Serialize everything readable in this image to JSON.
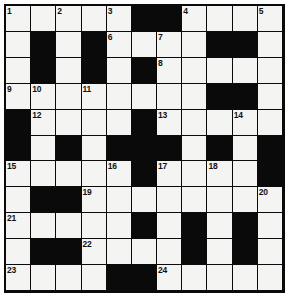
{
  "puzzle": {
    "title": "Crossword Grid",
    "type": "crossword",
    "rows": 11,
    "columns": 11,
    "colors": {
      "white_cell": "#f4f4f2",
      "black_cell": "#0a0a0a",
      "grid_line": "#0a0a0a",
      "number_text": "#111111",
      "page_background": "#ffffff"
    },
    "legend": {
      "white": "open / fillable letter square",
      "black": "blocked square"
    },
    "clue_numbers_present": [
      1,
      2,
      3,
      4,
      5,
      6,
      7,
      8,
      9,
      10,
      11,
      12,
      13,
      14,
      15,
      16,
      17,
      18,
      19,
      20,
      21,
      22,
      23,
      24
    ],
    "grid": [
      [
        {
          "state": "white",
          "number": "1"
        },
        {
          "state": "white",
          "number": ""
        },
        {
          "state": "white",
          "number": "2"
        },
        {
          "state": "white",
          "number": ""
        },
        {
          "state": "white",
          "number": "3"
        },
        {
          "state": "black",
          "number": ""
        },
        {
          "state": "black",
          "number": ""
        },
        {
          "state": "white",
          "number": "4"
        },
        {
          "state": "white",
          "number": ""
        },
        {
          "state": "white",
          "number": ""
        },
        {
          "state": "white",
          "number": "5"
        }
      ],
      [
        {
          "state": "white",
          "number": ""
        },
        {
          "state": "black",
          "number": ""
        },
        {
          "state": "white",
          "number": ""
        },
        {
          "state": "black",
          "number": ""
        },
        {
          "state": "white",
          "number": "6"
        },
        {
          "state": "white",
          "number": ""
        },
        {
          "state": "white",
          "number": "7"
        },
        {
          "state": "white",
          "number": ""
        },
        {
          "state": "black",
          "number": ""
        },
        {
          "state": "black",
          "number": ""
        },
        {
          "state": "white",
          "number": ""
        }
      ],
      [
        {
          "state": "white",
          "number": ""
        },
        {
          "state": "black",
          "number": ""
        },
        {
          "state": "white",
          "number": ""
        },
        {
          "state": "black",
          "number": ""
        },
        {
          "state": "white",
          "number": ""
        },
        {
          "state": "black",
          "number": ""
        },
        {
          "state": "white",
          "number": "8"
        },
        {
          "state": "white",
          "number": ""
        },
        {
          "state": "white",
          "number": ""
        },
        {
          "state": "white",
          "number": ""
        },
        {
          "state": "white",
          "number": ""
        }
      ],
      [
        {
          "state": "white",
          "number": "9"
        },
        {
          "state": "white",
          "number": "10"
        },
        {
          "state": "white",
          "number": ""
        },
        {
          "state": "white",
          "number": "11"
        },
        {
          "state": "white",
          "number": ""
        },
        {
          "state": "white",
          "number": ""
        },
        {
          "state": "white",
          "number": ""
        },
        {
          "state": "white",
          "number": ""
        },
        {
          "state": "black",
          "number": ""
        },
        {
          "state": "black",
          "number": ""
        },
        {
          "state": "white",
          "number": ""
        }
      ],
      [
        {
          "state": "black",
          "number": ""
        },
        {
          "state": "white",
          "number": "12"
        },
        {
          "state": "white",
          "number": ""
        },
        {
          "state": "white",
          "number": ""
        },
        {
          "state": "white",
          "number": ""
        },
        {
          "state": "black",
          "number": ""
        },
        {
          "state": "white",
          "number": "13"
        },
        {
          "state": "white",
          "number": ""
        },
        {
          "state": "white",
          "number": ""
        },
        {
          "state": "white",
          "number": "14"
        },
        {
          "state": "white",
          "number": ""
        }
      ],
      [
        {
          "state": "black",
          "number": ""
        },
        {
          "state": "white",
          "number": ""
        },
        {
          "state": "black",
          "number": ""
        },
        {
          "state": "white",
          "number": ""
        },
        {
          "state": "black",
          "number": ""
        },
        {
          "state": "black",
          "number": ""
        },
        {
          "state": "black",
          "number": ""
        },
        {
          "state": "white",
          "number": ""
        },
        {
          "state": "black",
          "number": ""
        },
        {
          "state": "white",
          "number": ""
        },
        {
          "state": "black",
          "number": ""
        }
      ],
      [
        {
          "state": "white",
          "number": "15"
        },
        {
          "state": "white",
          "number": ""
        },
        {
          "state": "white",
          "number": ""
        },
        {
          "state": "white",
          "number": ""
        },
        {
          "state": "white",
          "number": "16"
        },
        {
          "state": "black",
          "number": ""
        },
        {
          "state": "white",
          "number": "17"
        },
        {
          "state": "white",
          "number": ""
        },
        {
          "state": "white",
          "number": "18"
        },
        {
          "state": "white",
          "number": ""
        },
        {
          "state": "black",
          "number": ""
        }
      ],
      [
        {
          "state": "white",
          "number": ""
        },
        {
          "state": "black",
          "number": ""
        },
        {
          "state": "black",
          "number": ""
        },
        {
          "state": "white",
          "number": "19"
        },
        {
          "state": "white",
          "number": ""
        },
        {
          "state": "white",
          "number": ""
        },
        {
          "state": "white",
          "number": ""
        },
        {
          "state": "white",
          "number": ""
        },
        {
          "state": "white",
          "number": ""
        },
        {
          "state": "white",
          "number": ""
        },
        {
          "state": "white",
          "number": "20"
        }
      ],
      [
        {
          "state": "white",
          "number": "21"
        },
        {
          "state": "white",
          "number": ""
        },
        {
          "state": "white",
          "number": ""
        },
        {
          "state": "white",
          "number": ""
        },
        {
          "state": "white",
          "number": ""
        },
        {
          "state": "black",
          "number": ""
        },
        {
          "state": "white",
          "number": ""
        },
        {
          "state": "black",
          "number": ""
        },
        {
          "state": "white",
          "number": ""
        },
        {
          "state": "black",
          "number": ""
        },
        {
          "state": "white",
          "number": ""
        }
      ],
      [
        {
          "state": "white",
          "number": ""
        },
        {
          "state": "black",
          "number": ""
        },
        {
          "state": "black",
          "number": ""
        },
        {
          "state": "white",
          "number": "22"
        },
        {
          "state": "white",
          "number": ""
        },
        {
          "state": "white",
          "number": ""
        },
        {
          "state": "white",
          "number": ""
        },
        {
          "state": "black",
          "number": ""
        },
        {
          "state": "white",
          "number": ""
        },
        {
          "state": "black",
          "number": ""
        },
        {
          "state": "white",
          "number": ""
        }
      ],
      [
        {
          "state": "white",
          "number": "23"
        },
        {
          "state": "white",
          "number": ""
        },
        {
          "state": "white",
          "number": ""
        },
        {
          "state": "white",
          "number": ""
        },
        {
          "state": "black",
          "number": ""
        },
        {
          "state": "black",
          "number": ""
        },
        {
          "state": "white",
          "number": "24"
        },
        {
          "state": "white",
          "number": ""
        },
        {
          "state": "white",
          "number": ""
        },
        {
          "state": "white",
          "number": ""
        },
        {
          "state": "white",
          "number": ""
        }
      ]
    ]
  }
}
